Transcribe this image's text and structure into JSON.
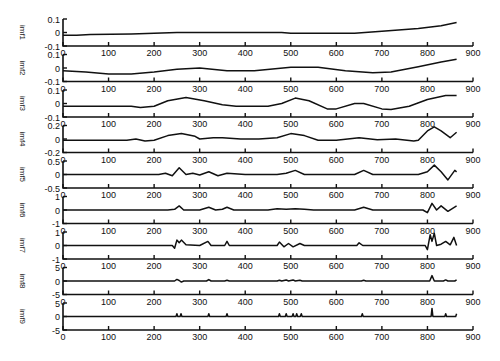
{
  "chart_data": {
    "type": "line",
    "title": "",
    "xlabel": "",
    "layout": {
      "subplots": 9,
      "arrangement": "stacked-vertical",
      "grid": false,
      "legend": "none"
    },
    "x_ticks": [
      0,
      100,
      200,
      300,
      400,
      500,
      600,
      700,
      800,
      900
    ],
    "xlim": [
      0,
      900
    ],
    "panels": [
      {
        "ylabel": "imf1",
        "ylim": [
          -0.1,
          0.1
        ],
        "yticks": [
          "0.1",
          "0",
          "-0.1"
        ],
        "points": [
          [
            0,
            -0.02
          ],
          [
            30,
            -0.02
          ],
          [
            60,
            -0.015
          ],
          [
            150,
            -0.01
          ],
          [
            200,
            -0.005
          ],
          [
            250,
            0
          ],
          [
            400,
            0
          ],
          [
            480,
            0
          ],
          [
            500,
            -0.005
          ],
          [
            640,
            -0.005
          ],
          [
            700,
            0.01
          ],
          [
            780,
            0.03
          ],
          [
            830,
            0.05
          ],
          [
            864,
            0.075
          ]
        ]
      },
      {
        "ylabel": "imf2",
        "ylim": [
          -0.1,
          0.1
        ],
        "yticks": [
          "0.1",
          "0",
          "-0.1"
        ],
        "points": [
          [
            0,
            -0.02
          ],
          [
            50,
            -0.03
          ],
          [
            100,
            -0.045
          ],
          [
            150,
            -0.045
          ],
          [
            200,
            -0.03
          ],
          [
            250,
            -0.01
          ],
          [
            300,
            0.0
          ],
          [
            360,
            -0.02
          ],
          [
            420,
            -0.02
          ],
          [
            500,
            0.005
          ],
          [
            560,
            0.005
          ],
          [
            620,
            -0.02
          ],
          [
            680,
            -0.035
          ],
          [
            720,
            -0.03
          ],
          [
            780,
            0.01
          ],
          [
            830,
            0.045
          ],
          [
            864,
            0.065
          ]
        ]
      },
      {
        "ylabel": "imf3",
        "ylim": [
          -0.1,
          0.1
        ],
        "yticks": [
          "0.1",
          "0",
          "-0.1"
        ],
        "points": [
          [
            0,
            -0.02
          ],
          [
            150,
            -0.02
          ],
          [
            170,
            -0.03
          ],
          [
            200,
            -0.02
          ],
          [
            230,
            0.02
          ],
          [
            270,
            0.045
          ],
          [
            310,
            0.02
          ],
          [
            350,
            -0.01
          ],
          [
            380,
            -0.02
          ],
          [
            450,
            -0.02
          ],
          [
            480,
            0.0
          ],
          [
            510,
            0.04
          ],
          [
            540,
            0.02
          ],
          [
            580,
            -0.04
          ],
          [
            600,
            -0.04
          ],
          [
            640,
            0.0
          ],
          [
            660,
            0.0
          ],
          [
            700,
            -0.04
          ],
          [
            720,
            -0.045
          ],
          [
            760,
            -0.02
          ],
          [
            800,
            0.03
          ],
          [
            840,
            0.06
          ],
          [
            864,
            0.06
          ]
        ]
      },
      {
        "ylabel": "imf4",
        "ylim": [
          -0.2,
          0.2
        ],
        "yticks": [
          "0.2",
          "0",
          "-0.2"
        ],
        "points": [
          [
            0,
            -0.02
          ],
          [
            140,
            -0.02
          ],
          [
            160,
            0.0
          ],
          [
            180,
            -0.03
          ],
          [
            200,
            -0.02
          ],
          [
            230,
            0.05
          ],
          [
            260,
            0.08
          ],
          [
            290,
            0.04
          ],
          [
            300,
            0.0
          ],
          [
            330,
            0.02
          ],
          [
            350,
            0.02
          ],
          [
            390,
            0.0
          ],
          [
            430,
            0.0
          ],
          [
            470,
            0.02
          ],
          [
            500,
            0.08
          ],
          [
            530,
            0.05
          ],
          [
            560,
            -0.02
          ],
          [
            600,
            -0.02
          ],
          [
            650,
            0.02
          ],
          [
            690,
            -0.01
          ],
          [
            730,
            0.0
          ],
          [
            770,
            -0.03
          ],
          [
            780,
            -0.02
          ],
          [
            800,
            0.12
          ],
          [
            815,
            0.18
          ],
          [
            830,
            0.12
          ],
          [
            850,
            0.02
          ],
          [
            864,
            0.1
          ]
        ]
      },
      {
        "ylabel": "imf5",
        "ylim": [
          -0.5,
          0.5
        ],
        "yticks": [
          "0.5",
          "0",
          "-0.5"
        ],
        "points": [
          [
            0,
            0
          ],
          [
            210,
            0
          ],
          [
            225,
            0.05
          ],
          [
            240,
            -0.05
          ],
          [
            255,
            0.25
          ],
          [
            270,
            0.0
          ],
          [
            285,
            0.05
          ],
          [
            300,
            -0.02
          ],
          [
            320,
            0.1
          ],
          [
            340,
            -0.05
          ],
          [
            360,
            0.05
          ],
          [
            400,
            0.0
          ],
          [
            470,
            0.0
          ],
          [
            490,
            0.05
          ],
          [
            510,
            0.15
          ],
          [
            530,
            0.0
          ],
          [
            600,
            0.0
          ],
          [
            640,
            0.0
          ],
          [
            660,
            0.15
          ],
          [
            680,
            0.0
          ],
          [
            780,
            0.0
          ],
          [
            800,
            0.1
          ],
          [
            815,
            0.35
          ],
          [
            830,
            0.1
          ],
          [
            845,
            -0.2
          ],
          [
            860,
            0.15
          ],
          [
            864,
            0.1
          ]
        ]
      },
      {
        "ylabel": "imf6",
        "ylim": [
          -1,
          1
        ],
        "yticks": [
          "1",
          "0",
          "-1"
        ],
        "points": [
          [
            0,
            0
          ],
          [
            230,
            0
          ],
          [
            245,
            0.05
          ],
          [
            255,
            0.3
          ],
          [
            265,
            0.0
          ],
          [
            300,
            0.0
          ],
          [
            320,
            0.2
          ],
          [
            335,
            0.0
          ],
          [
            350,
            0.05
          ],
          [
            360,
            0.2
          ],
          [
            375,
            0.0
          ],
          [
            450,
            0.0
          ],
          [
            470,
            0.1
          ],
          [
            490,
            0.05
          ],
          [
            510,
            0.1
          ],
          [
            530,
            0.05
          ],
          [
            550,
            0.0
          ],
          [
            640,
            0.0
          ],
          [
            660,
            0.2
          ],
          [
            680,
            0.0
          ],
          [
            790,
            0.0
          ],
          [
            800,
            -0.2
          ],
          [
            810,
            0.5
          ],
          [
            820,
            0.0
          ],
          [
            830,
            0.3
          ],
          [
            845,
            -0.1
          ],
          [
            864,
            0.3
          ]
        ]
      },
      {
        "ylabel": "imf7",
        "ylim": [
          -1,
          1
        ],
        "yticks": [
          "1",
          "0",
          "-1"
        ],
        "points": [
          [
            0,
            0
          ],
          [
            240,
            0
          ],
          [
            245,
            -0.2
          ],
          [
            250,
            0.4
          ],
          [
            255,
            0.2
          ],
          [
            260,
            0.4
          ],
          [
            270,
            0.05
          ],
          [
            300,
            0.0
          ],
          [
            318,
            0.3
          ],
          [
            325,
            0.0
          ],
          [
            355,
            0.0
          ],
          [
            360,
            0.3
          ],
          [
            365,
            0.0
          ],
          [
            470,
            0.0
          ],
          [
            475,
            0.25
          ],
          [
            485,
            -0.1
          ],
          [
            495,
            0.15
          ],
          [
            505,
            -0.1
          ],
          [
            520,
            0.15
          ],
          [
            530,
            0.0
          ],
          [
            645,
            0.0
          ],
          [
            650,
            0.2
          ],
          [
            658,
            0.0
          ],
          [
            795,
            0.0
          ],
          [
            800,
            -0.3
          ],
          [
            806,
            0.8
          ],
          [
            810,
            0.3
          ],
          [
            815,
            0.9
          ],
          [
            820,
            0.0
          ],
          [
            830,
            0.1
          ],
          [
            840,
            0.3
          ],
          [
            850,
            0.05
          ],
          [
            858,
            0.6
          ],
          [
            864,
            0.0
          ]
        ]
      },
      {
        "ylabel": "imf8",
        "ylim": [
          -5,
          5
        ],
        "yticks": [
          "5",
          "0",
          "-5"
        ],
        "points": [
          [
            0,
            0
          ],
          [
            245,
            0
          ],
          [
            250,
            0.6
          ],
          [
            255,
            0.2
          ],
          [
            260,
            -0.4
          ],
          [
            265,
            0.0
          ],
          [
            315,
            0.0
          ],
          [
            320,
            0.5
          ],
          [
            325,
            0.0
          ],
          [
            355,
            0.0
          ],
          [
            360,
            0.3
          ],
          [
            365,
            0.0
          ],
          [
            470,
            0.0
          ],
          [
            475,
            0.3
          ],
          [
            480,
            0.0
          ],
          [
            490,
            0.4
          ],
          [
            495,
            0.0
          ],
          [
            505,
            0.4
          ],
          [
            510,
            0.0
          ],
          [
            520,
            0.3
          ],
          [
            525,
            0.0
          ],
          [
            655,
            0.0
          ],
          [
            660,
            0.3
          ],
          [
            665,
            0.0
          ],
          [
            805,
            0.0
          ],
          [
            810,
            2.0
          ],
          [
            815,
            0.0
          ],
          [
            835,
            0.0
          ],
          [
            840,
            0.4
          ],
          [
            845,
            0.0
          ],
          [
            860,
            0.0
          ],
          [
            864,
            0.4
          ]
        ]
      },
      {
        "ylabel": "imf9",
        "ylim": [
          -5,
          5
        ],
        "yticks": [
          "5",
          "0",
          "-5"
        ],
        "points": [
          [
            0,
            0
          ],
          [
            248,
            0
          ],
          [
            250,
            1.0
          ],
          [
            252,
            0
          ],
          [
            257,
            0
          ],
          [
            259,
            1.0
          ],
          [
            261,
            0
          ],
          [
            318,
            0
          ],
          [
            320,
            1.0
          ],
          [
            322,
            0
          ],
          [
            358,
            0
          ],
          [
            360,
            1.0
          ],
          [
            362,
            0
          ],
          [
            473,
            0
          ],
          [
            475,
            1.0
          ],
          [
            477,
            0
          ],
          [
            488,
            0
          ],
          [
            490,
            1.0
          ],
          [
            492,
            0
          ],
          [
            503,
            0
          ],
          [
            505,
            1.0
          ],
          [
            507,
            0
          ],
          [
            511,
            0
          ],
          [
            513,
            1.0
          ],
          [
            515,
            0
          ],
          [
            521,
            0
          ],
          [
            523,
            1.0
          ],
          [
            525,
            0
          ],
          [
            655,
            0
          ],
          [
            657,
            1.0
          ],
          [
            659,
            0
          ],
          [
            808,
            0
          ],
          [
            810,
            3.0
          ],
          [
            812,
            0
          ],
          [
            838,
            0
          ],
          [
            840,
            1.0
          ],
          [
            842,
            0
          ],
          [
            862,
            0
          ],
          [
            864,
            1.0
          ]
        ]
      }
    ]
  }
}
